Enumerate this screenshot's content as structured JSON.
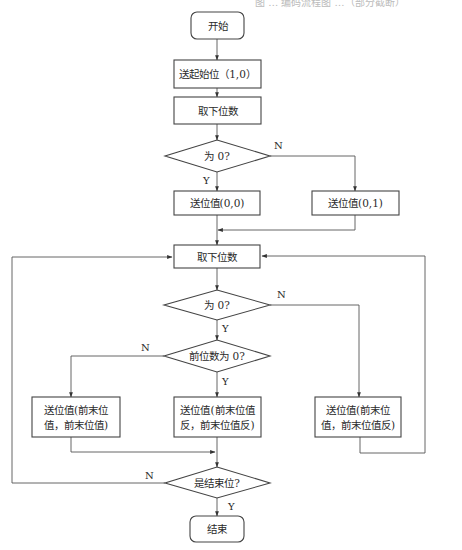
{
  "header": {
    "caption_fragment": "图 … 编码流程图 …（部分截断）"
  },
  "colors": {
    "stroke": "#444444",
    "edge": "#555555",
    "background": "#ffffff",
    "text": "#2a2a2a"
  },
  "nodes": {
    "start": {
      "type": "terminal",
      "text": "开始"
    },
    "send_start": {
      "type": "process",
      "text": "送起始位（1,0）"
    },
    "get_bit_1": {
      "type": "process",
      "text": "取下位数"
    },
    "is_zero_1": {
      "type": "decision",
      "text": "为 0?"
    },
    "send_00": {
      "type": "process",
      "text": "送位值(0,0)"
    },
    "send_01": {
      "type": "process",
      "text": "送位值(0,1)"
    },
    "get_bit_2": {
      "type": "process",
      "text": "取下位数"
    },
    "is_zero_2": {
      "type": "decision",
      "text": "为 0?"
    },
    "prev_is_zero": {
      "type": "decision",
      "text": "前位数为 0?"
    },
    "send_prev_same": {
      "type": "process",
      "line1": "送位值(前末位",
      "line2": "值，前末位值)"
    },
    "send_prev_inv_both": {
      "type": "process",
      "line1": "送位值(前末位值",
      "line2": "反，前末位值反)"
    },
    "send_prev_inv_second": {
      "type": "process",
      "line1": "送位值(前末位",
      "line2": "值，前末位值反)"
    },
    "is_end": {
      "type": "decision",
      "text": "是结束位?"
    },
    "end": {
      "type": "terminal",
      "text": "结束"
    }
  },
  "edge_labels": {
    "is_zero_1_yes": "Y",
    "is_zero_1_no": "N",
    "is_zero_2_yes": "Y",
    "is_zero_2_no": "N",
    "prev_is_zero_yes": "Y",
    "prev_is_zero_no": "N",
    "is_end_yes": "Y",
    "is_end_no": "N"
  }
}
